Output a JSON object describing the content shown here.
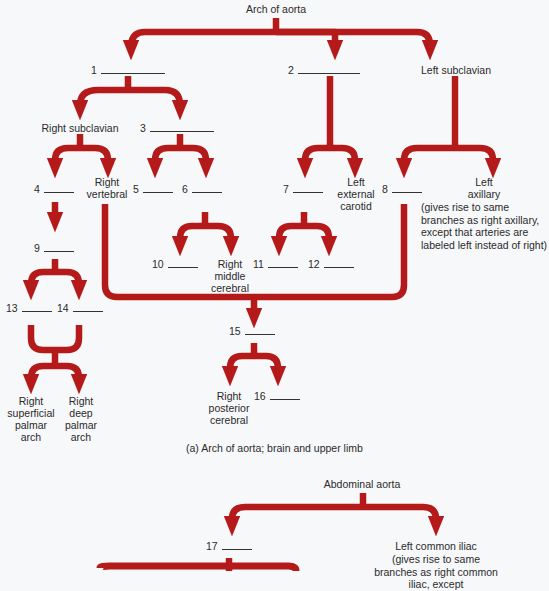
{
  "colors": {
    "arrow": "#b51a1a",
    "background": "#f7f8fa",
    "text": "#2a2a2a"
  },
  "diagram_a": {
    "root": "Arch of aorta",
    "caption": "(a)  Arch of aorta; brain and upper limb",
    "labels": {
      "n1": "1",
      "n2": "2",
      "n3": "3",
      "n4": "4",
      "n5": "5",
      "n6": "6",
      "n7": "7",
      "n8": "8",
      "n9": "9",
      "n10": "10",
      "n11": "11",
      "n12": "12",
      "n13": "13",
      "n14": "14",
      "n15": "15",
      "n16": "16",
      "left_subclavian": "Left subclavian",
      "right_subclavian": "Right subclavian",
      "right_vertebral": "Right\nvertebral",
      "left_external_carotid": "Left\nexternal\ncarotid",
      "left_axillary": "Left\naxillary",
      "left_axillary_note": "(gives rise to same branches as right axillary, except that arteries are labeled left instead of right)",
      "right_middle_cerebral": "Right\nmiddle\ncerebral",
      "right_posterior_cerebral": "Right\nposterior\ncerebral",
      "right_superficial_palmar_arch": "Right\nsuperficial\npalmar\narch",
      "right_deep_palmar_arch": "Right\ndeep\npalmar\narch"
    }
  },
  "diagram_b": {
    "root": "Abdominal aorta",
    "labels": {
      "n17": "17",
      "left_common_iliac": "Left common iliac",
      "left_common_iliac_note": "(gives rise to same branches as right common iliac, except"
    }
  }
}
